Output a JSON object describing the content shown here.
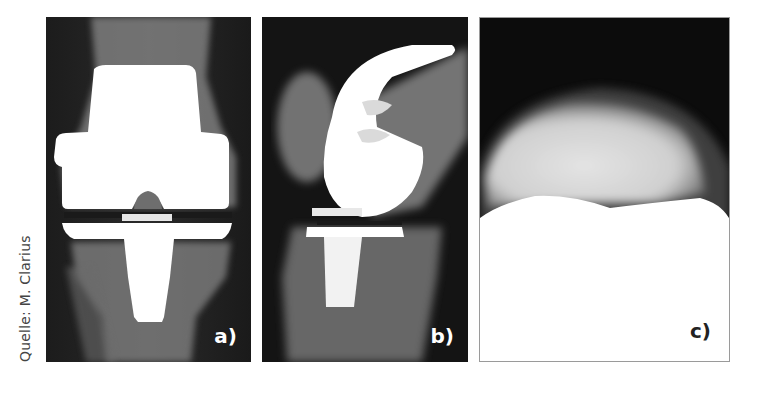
{
  "figure": {
    "caption": "Quelle: M. Clarius",
    "panels": [
      {
        "id": "a",
        "label": "a)",
        "view": "knee-prosthesis-xray-ap"
      },
      {
        "id": "b",
        "label": "b)",
        "view": "knee-prosthesis-xray-lateral"
      },
      {
        "id": "c",
        "label": "c)",
        "view": "patella-xray-axial"
      }
    ]
  },
  "colors": {
    "background": "#ffffff",
    "xray_dark": "#141414",
    "implant": "#ffffff",
    "bone": "#9a9a9a",
    "label_light": "#ffffff",
    "label_dark": "#222222",
    "caption": "#444444"
  }
}
